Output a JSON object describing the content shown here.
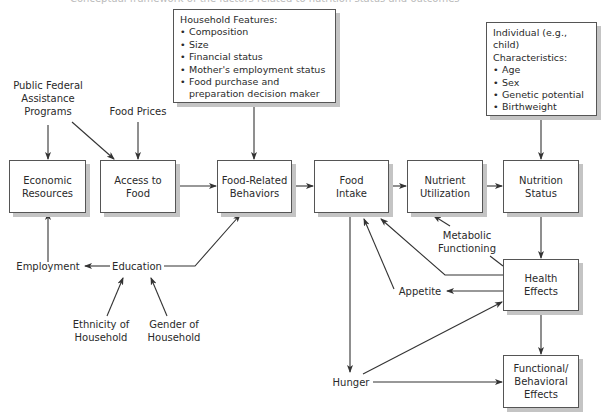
{
  "header": {
    "cut_off_caption": "Conceptual framework of the factors related to nutrition status and outcomes"
  },
  "boxes": {
    "economic_resources": "Economic\nResources",
    "access_to_food": "Access to\nFood",
    "food_related_behaviors": "Food-Related\nBehaviors",
    "food_intake": "Food\nIntake",
    "nutrient_utilization": "Nutrient\nUtilization",
    "nutrition_status": "Nutrition\nStatus",
    "health_effects": "Health\nEffects",
    "functional_behavioral_effects": "Functional/\nBehavioral\nEffects"
  },
  "household_features": {
    "title": "Household Features:",
    "items": [
      "Composition",
      "Size",
      "Financial status",
      "Mother's employment status",
      "Food purchase and preparation decision maker"
    ]
  },
  "individual_characteristics": {
    "title": "Individual (e.g., child)\nCharacteristics:",
    "items": [
      "Age",
      "Sex",
      "Genetic potential",
      "Birthweight"
    ]
  },
  "labels": {
    "public_federal": "Public Federal\nAssistance\nPrograms",
    "food_prices": "Food Prices",
    "employment": "Employment",
    "education": "Education",
    "ethnicity": "Ethnicity of\nHousehold",
    "gender": "Gender of\nHousehold",
    "metabolic": "Metabolic\nFunctioning",
    "appetite": "Appetite",
    "hunger": "Hunger"
  }
}
